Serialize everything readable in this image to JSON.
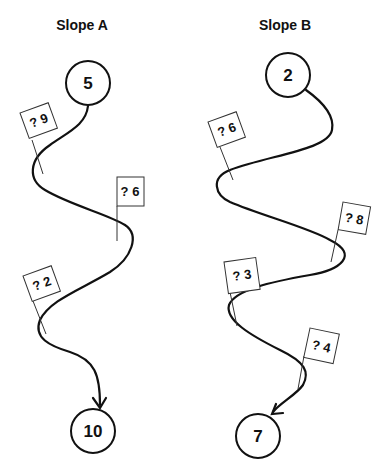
{
  "slopes": [
    {
      "title": "Slope A",
      "start": "5",
      "end": "10",
      "flags": [
        {
          "label": "? 9"
        },
        {
          "label": "? 6"
        },
        {
          "label": "? 2"
        }
      ]
    },
    {
      "title": "Slope B",
      "start": "2",
      "end": "7",
      "flags": [
        {
          "label": "? 6"
        },
        {
          "label": "? 8"
        },
        {
          "label": "? 3"
        },
        {
          "label": "? 4"
        }
      ]
    }
  ],
  "colors": {
    "stroke": "#111111",
    "background": "#ffffff"
  }
}
